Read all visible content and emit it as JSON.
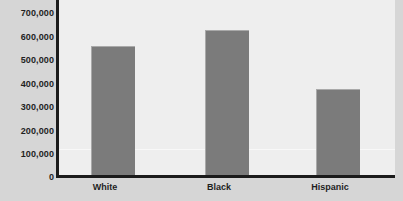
{
  "chart_data": {
    "type": "bar",
    "title": "",
    "subtitle": "",
    "xlabel": "",
    "ylabel": "",
    "categories": [
      "White",
      "Black",
      "Hispanic"
    ],
    "values": [
      517000,
      581000,
      346000
    ],
    "series": [
      {
        "name": "",
        "values": [
          517000,
          581000,
          346000
        ]
      }
    ],
    "ylim": [
      0,
      700000
    ],
    "y_ticks": [
      0,
      100000,
      200000,
      300000,
      400000,
      500000,
      600000,
      700000
    ],
    "y_tick_labels": [
      "700,000",
      "600,000",
      "500,000",
      "400,000",
      "300,000",
      "200,000",
      "100,000",
      "0"
    ],
    "grid": "single-faint-horizontal-line-near-100000",
    "legend": null,
    "legend_position": "none",
    "annotations": [],
    "colors": {
      "bar_fill": "#7b7b7b",
      "bar_highlight": "#a9a9a9",
      "plot_background": "#eeeeee",
      "figure_background": "#d6d6d6",
      "axis": "#1b1b1b",
      "text": "#1f1f1f",
      "gridline": "#f8f8f8"
    }
  }
}
